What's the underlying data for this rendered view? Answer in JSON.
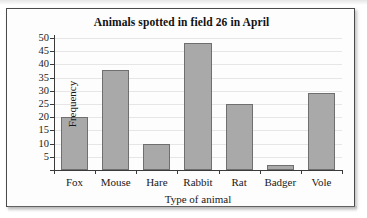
{
  "figure": {
    "frame_color": "#4a4a4a",
    "background": "#fdfdfd"
  },
  "chart_data": {
    "type": "bar",
    "title": "Animals spotted in field 26 in April",
    "xlabel": "Type of animal",
    "ylabel": "Frequency",
    "categories": [
      "Fox",
      "Mouse",
      "Hare",
      "Rabbit",
      "Rat",
      "Badger",
      "Vole"
    ],
    "values": [
      20,
      38,
      10,
      48,
      25,
      2,
      29
    ],
    "ylim": [
      0,
      50
    ],
    "ytick_values": [
      5,
      10,
      15,
      20,
      25,
      30,
      35,
      40,
      45,
      50
    ],
    "ytick_labels": [
      "5",
      "10",
      "15",
      "20",
      "25",
      "30",
      "35",
      "40",
      "45",
      "50"
    ],
    "ytick_step": 5,
    "grid": true,
    "grid_axis": "y",
    "grid_color": "#e6e6e6",
    "legend": false,
    "bar_fill_color": "#a9a9a9",
    "bar_edge_color": "#6f6f6f",
    "axis_color": "#3a3a3a",
    "text_color": "#1a1a1a"
  }
}
